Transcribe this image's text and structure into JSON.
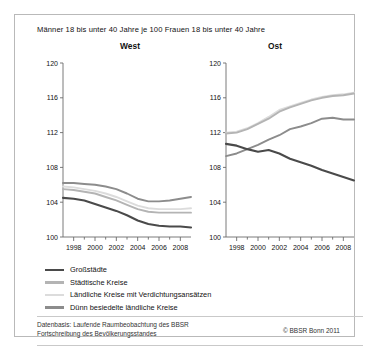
{
  "figure": {
    "title": "Männer 18 bis unter 40 Jahre je 100 Frauen 18 bis unter 40 Jahre",
    "panel_west_title": "West",
    "panel_ost_title": "Ost",
    "source_line1": "Datenbasis: Laufende Raumbeobachtung des BBSR",
    "source_line2": "Fortschreibung des Bevölkerungsstandes",
    "copyright": "© BBSR Bonn 2011"
  },
  "legend": {
    "items": [
      {
        "label": "Großstädte",
        "color": "#4a4a4a"
      },
      {
        "label": "Städtische Kreise",
        "color": "#b4b4b4"
      },
      {
        "label": "Ländliche Kreise mit Verdichtungsansätzen",
        "color": "#dcdcdc"
      },
      {
        "label": "Dünn besiedelte ländliche Kreise",
        "color": "#8c8c8c"
      }
    ]
  },
  "chart_data": [
    {
      "type": "line",
      "title": "West",
      "xlabel": "",
      "ylabel": "",
      "x": [
        1997,
        1998,
        1999,
        2000,
        2001,
        2002,
        2003,
        2004,
        2005,
        2006,
        2007,
        2008,
        2009
      ],
      "xtick_labels": [
        "1998",
        "2000",
        "2002",
        "2004",
        "2006",
        "2008"
      ],
      "xtick_values": [
        1998,
        2000,
        2002,
        2004,
        2006,
        2008
      ],
      "xlim": [
        1997,
        2009
      ],
      "ylim": [
        100,
        120
      ],
      "ytick_values": [
        100,
        104,
        108,
        112,
        116,
        120
      ],
      "grid": false,
      "legend_position": "below",
      "series": [
        {
          "name": "Großstädte",
          "color": "#4a4a4a",
          "values": [
            104.5,
            104.4,
            104.2,
            103.8,
            103.4,
            103.0,
            102.5,
            101.9,
            101.5,
            101.3,
            101.2,
            101.2,
            101.1
          ]
        },
        {
          "name": "Städtische Kreise",
          "color": "#b4b4b4",
          "values": [
            105.5,
            105.4,
            105.2,
            105.0,
            104.6,
            104.2,
            103.7,
            103.2,
            102.9,
            102.8,
            102.8,
            102.8,
            102.8
          ]
        },
        {
          "name": "Ländliche Kreise mit Verdichtungsansätzen",
          "color": "#dcdcdc",
          "values": [
            105.8,
            105.7,
            105.5,
            105.3,
            105.0,
            104.6,
            104.1,
            103.6,
            103.3,
            103.2,
            103.2,
            103.2,
            103.3
          ]
        },
        {
          "name": "Dünn besiedelte ländliche Kreise",
          "color": "#8c8c8c",
          "values": [
            106.2,
            106.2,
            106.1,
            106.0,
            105.8,
            105.5,
            105.0,
            104.4,
            104.1,
            104.1,
            104.2,
            104.4,
            104.6
          ]
        }
      ]
    },
    {
      "type": "line",
      "title": "Ost",
      "xlabel": "",
      "ylabel": "",
      "x": [
        1997,
        1998,
        1999,
        2000,
        2001,
        2002,
        2003,
        2004,
        2005,
        2006,
        2007,
        2008,
        2009
      ],
      "xtick_labels": [
        "1998",
        "2000",
        "2002",
        "2004",
        "2006",
        "2008"
      ],
      "xtick_values": [
        1998,
        2000,
        2002,
        2004,
        2006,
        2008
      ],
      "xlim": [
        1997,
        2009
      ],
      "ylim": [
        100,
        120
      ],
      "ytick_values": [
        100,
        104,
        108,
        112,
        116,
        120
      ],
      "grid": false,
      "legend_position": "below",
      "series": [
        {
          "name": "Großstädte",
          "color": "#4a4a4a",
          "values": [
            110.7,
            110.5,
            110.1,
            109.8,
            110.0,
            109.6,
            109.0,
            108.6,
            108.2,
            107.7,
            107.3,
            106.9,
            106.5
          ]
        },
        {
          "name": "Städtische Kreise",
          "color": "#b4b4b4",
          "values": [
            111.9,
            112.0,
            112.4,
            113.0,
            113.6,
            114.4,
            114.9,
            115.3,
            115.7,
            116.0,
            116.2,
            116.3,
            116.5
          ]
        },
        {
          "name": "Ländliche Kreise mit Verdichtungsansätzen",
          "color": "#dcdcdc",
          "values": [
            112.0,
            112.1,
            112.5,
            113.1,
            113.8,
            114.6,
            115.0,
            115.4,
            115.8,
            116.1,
            116.3,
            116.4,
            116.6
          ]
        },
        {
          "name": "Dünn besiedelte ländliche Kreise",
          "color": "#8c8c8c",
          "values": [
            109.3,
            109.6,
            110.1,
            110.6,
            111.2,
            111.7,
            112.4,
            112.7,
            113.1,
            113.6,
            113.7,
            113.5,
            113.5
          ]
        }
      ]
    }
  ]
}
